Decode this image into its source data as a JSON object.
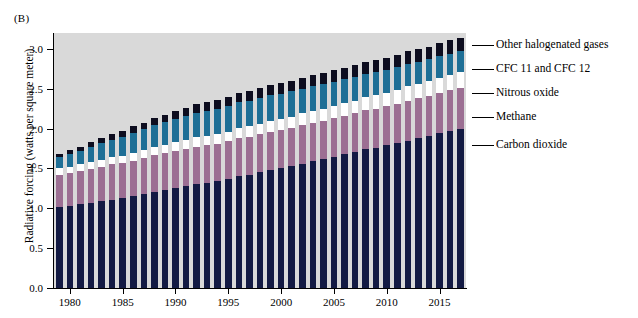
{
  "figure": {
    "panel_label": "(B)",
    "y_axis_title": "Radiative forcing (watts per square meter)"
  },
  "legend": {
    "items": [
      {
        "label": "Other halogenated gases",
        "color": "#0d0d1f"
      },
      {
        "label": "CFC 11 and CFC 12",
        "color": "#1f6f96"
      },
      {
        "label": "Nitrous oxide",
        "color": "#ffffff"
      },
      {
        "label": "Methane",
        "color": "#9c6f93"
      },
      {
        "label": "Carbon dioxide",
        "color": "#131a43"
      }
    ]
  },
  "chart_data": {
    "type": "bar",
    "stacked": true,
    "title": "",
    "xlabel": "",
    "ylabel": "Radiative forcing (watts per square meter)",
    "ylim": [
      0.0,
      3.2
    ],
    "yticks": [
      "0.0",
      "0.5",
      "1.0",
      "1.5",
      "2.0",
      "2.5",
      "3.0"
    ],
    "ytick_values": [
      0.0,
      0.5,
      1.0,
      1.5,
      2.0,
      2.5,
      3.0
    ],
    "xticks": [
      "1980",
      "1985",
      "1990",
      "1995",
      "2000",
      "2005",
      "2010",
      "2015"
    ],
    "xtick_values": [
      1980,
      1985,
      1990,
      1995,
      2000,
      2005,
      2010,
      2015
    ],
    "grid": false,
    "legend_position": "right",
    "plot_background": "#d9d9d9",
    "categories": [
      1979,
      1980,
      1981,
      1982,
      1983,
      1984,
      1985,
      1986,
      1987,
      1988,
      1989,
      1990,
      1991,
      1992,
      1993,
      1994,
      1995,
      1996,
      1997,
      1998,
      1999,
      2000,
      2001,
      2002,
      2003,
      2004,
      2005,
      2006,
      2007,
      2008,
      2009,
      2010,
      2011,
      2012,
      2013,
      2014,
      2015,
      2016,
      2017
    ],
    "series": [
      {
        "name": "Carbon dioxide",
        "color": "#131a43",
        "values": [
          1.02,
          1.03,
          1.05,
          1.07,
          1.09,
          1.11,
          1.13,
          1.15,
          1.18,
          1.21,
          1.23,
          1.25,
          1.28,
          1.3,
          1.32,
          1.34,
          1.37,
          1.4,
          1.42,
          1.45,
          1.48,
          1.5,
          1.53,
          1.56,
          1.59,
          1.62,
          1.65,
          1.68,
          1.71,
          1.74,
          1.76,
          1.79,
          1.82,
          1.85,
          1.88,
          1.91,
          1.94,
          1.97,
          2.0
        ]
      },
      {
        "name": "Methane",
        "color": "#9c6f93",
        "values": [
          0.4,
          0.41,
          0.42,
          0.42,
          0.43,
          0.44,
          0.44,
          0.45,
          0.45,
          0.46,
          0.46,
          0.47,
          0.47,
          0.47,
          0.47,
          0.47,
          0.47,
          0.48,
          0.48,
          0.48,
          0.48,
          0.48,
          0.48,
          0.48,
          0.48,
          0.48,
          0.48,
          0.48,
          0.48,
          0.49,
          0.49,
          0.49,
          0.49,
          0.5,
          0.5,
          0.5,
          0.51,
          0.51,
          0.51
        ]
      },
      {
        "name": "Nitrous oxide",
        "color": "#ffffff",
        "values": [
          0.08,
          0.08,
          0.08,
          0.09,
          0.09,
          0.09,
          0.09,
          0.1,
          0.1,
          0.1,
          0.11,
          0.11,
          0.11,
          0.12,
          0.12,
          0.12,
          0.12,
          0.13,
          0.13,
          0.13,
          0.14,
          0.14,
          0.14,
          0.15,
          0.15,
          0.15,
          0.16,
          0.16,
          0.16,
          0.17,
          0.17,
          0.17,
          0.18,
          0.18,
          0.18,
          0.19,
          0.19,
          0.19,
          0.2
        ]
      },
      {
        "name": "CFC 11 and CFC 12",
        "color": "#1f6f96",
        "values": [
          0.14,
          0.16,
          0.17,
          0.19,
          0.21,
          0.22,
          0.24,
          0.25,
          0.26,
          0.27,
          0.28,
          0.29,
          0.3,
          0.31,
          0.31,
          0.32,
          0.32,
          0.32,
          0.32,
          0.32,
          0.32,
          0.32,
          0.32,
          0.31,
          0.31,
          0.31,
          0.3,
          0.3,
          0.3,
          0.29,
          0.29,
          0.29,
          0.28,
          0.28,
          0.28,
          0.27,
          0.27,
          0.27,
          0.26
        ]
      },
      {
        "name": "Other halogenated gases",
        "color": "#0d0d1f",
        "values": [
          0.04,
          0.05,
          0.05,
          0.06,
          0.06,
          0.07,
          0.07,
          0.08,
          0.08,
          0.09,
          0.09,
          0.1,
          0.1,
          0.11,
          0.11,
          0.11,
          0.12,
          0.12,
          0.12,
          0.13,
          0.13,
          0.13,
          0.13,
          0.14,
          0.14,
          0.14,
          0.14,
          0.14,
          0.15,
          0.15,
          0.15,
          0.15,
          0.16,
          0.16,
          0.16,
          0.16,
          0.17,
          0.17,
          0.17
        ]
      }
    ],
    "totals": [
      1.68,
      1.73,
      1.77,
      1.83,
      1.88,
      1.93,
      1.97,
      2.03,
      2.07,
      2.13,
      2.17,
      2.22,
      2.26,
      2.31,
      2.33,
      2.36,
      2.4,
      2.45,
      2.47,
      2.51,
      2.55,
      2.57,
      2.6,
      2.64,
      2.67,
      2.7,
      2.73,
      2.76,
      2.8,
      2.84,
      2.86,
      2.89,
      2.93,
      2.97,
      3.0,
      3.03,
      3.08,
      3.11,
      3.14
    ]
  }
}
